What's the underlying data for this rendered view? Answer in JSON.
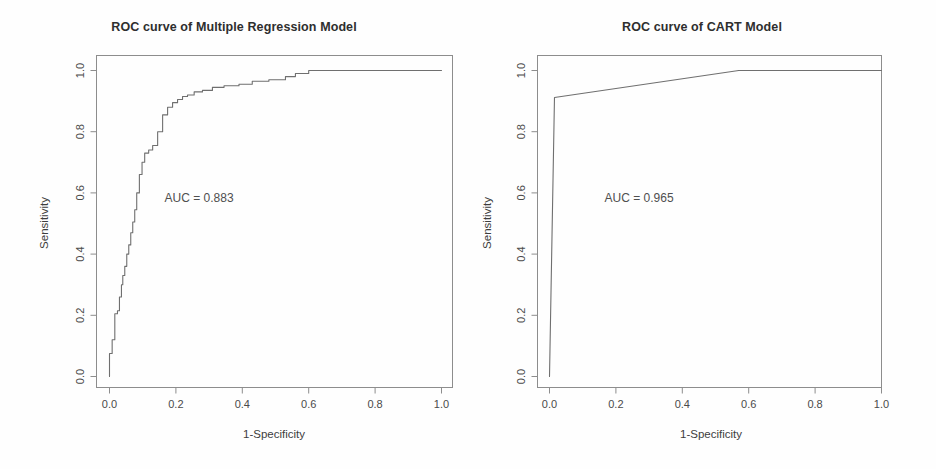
{
  "figure": {
    "width": 936,
    "height": 469,
    "background": "#fefefe",
    "line_color": "#6f6f6f",
    "frame_color": "#8d8d8d",
    "text_color": "#3a3a3a"
  },
  "panels": [
    {
      "id": "multiple-regression",
      "title": "ROC curve of Multiple Regression Model",
      "auc_label": "AUC = 0.883",
      "xlabel": "1-Specificity",
      "ylabel": "Sensitivity"
    },
    {
      "id": "cart",
      "title": "ROC curve of CART Model",
      "auc_label": "AUC = 0.965",
      "xlabel": "1-Specificity",
      "ylabel": "Sensitivity"
    }
  ],
  "axis": {
    "xticks": [
      "0.0",
      "0.2",
      "0.4",
      "0.6",
      "0.8",
      "1.0"
    ],
    "yticks": [
      "0.0",
      "0.2",
      "0.4",
      "0.6",
      "0.8",
      "1.0"
    ],
    "xtick_values": [
      0.0,
      0.2,
      0.4,
      0.6,
      0.8,
      1.0
    ],
    "ytick_values": [
      0.0,
      0.2,
      0.4,
      0.6,
      0.8,
      1.0
    ]
  },
  "chart_data": {
    "type": "line",
    "xlabel": "1-Specificity",
    "ylabel": "Sensitivity",
    "xlim": [
      0.0,
      1.0
    ],
    "ylim": [
      0.0,
      1.0
    ],
    "grid": false,
    "legend": "none",
    "panels": [
      {
        "name": "ROC curve of Multiple Regression Model",
        "auc": 0.883,
        "annotation": "AUC = 0.883",
        "annotation_xy": [
          0.27,
          0.57
        ],
        "x": [
          0.0,
          0.0,
          0.008,
          0.008,
          0.016,
          0.016,
          0.024,
          0.024,
          0.03,
          0.03,
          0.036,
          0.036,
          0.04,
          0.04,
          0.046,
          0.046,
          0.052,
          0.052,
          0.058,
          0.058,
          0.064,
          0.064,
          0.07,
          0.07,
          0.076,
          0.076,
          0.082,
          0.082,
          0.09,
          0.09,
          0.098,
          0.098,
          0.106,
          0.106,
          0.118,
          0.118,
          0.13,
          0.13,
          0.145,
          0.145,
          0.16,
          0.16,
          0.175,
          0.175,
          0.19,
          0.19,
          0.205,
          0.205,
          0.22,
          0.22,
          0.235,
          0.235,
          0.255,
          0.255,
          0.28,
          0.28,
          0.31,
          0.31,
          0.345,
          0.345,
          0.39,
          0.39,
          0.43,
          0.43,
          0.48,
          0.48,
          0.53,
          0.53,
          0.56,
          0.56,
          0.6,
          0.6,
          1.0
        ],
        "y": [
          0.0,
          0.075,
          0.075,
          0.12,
          0.12,
          0.205,
          0.205,
          0.215,
          0.215,
          0.26,
          0.26,
          0.3,
          0.3,
          0.33,
          0.33,
          0.36,
          0.36,
          0.4,
          0.4,
          0.43,
          0.43,
          0.47,
          0.47,
          0.505,
          0.505,
          0.545,
          0.545,
          0.6,
          0.6,
          0.66,
          0.66,
          0.7,
          0.7,
          0.73,
          0.73,
          0.74,
          0.74,
          0.755,
          0.755,
          0.8,
          0.8,
          0.855,
          0.855,
          0.88,
          0.88,
          0.895,
          0.895,
          0.905,
          0.905,
          0.915,
          0.915,
          0.92,
          0.92,
          0.93,
          0.93,
          0.935,
          0.935,
          0.945,
          0.945,
          0.95,
          0.95,
          0.955,
          0.955,
          0.965,
          0.965,
          0.97,
          0.97,
          0.98,
          0.98,
          0.99,
          0.99,
          1.0,
          1.0
        ]
      },
      {
        "name": "ROC curve of CART Model",
        "auc": 0.965,
        "annotation": "AUC = 0.965",
        "annotation_xy": [
          0.27,
          0.57
        ],
        "x": [
          0.0,
          0.015,
          0.57,
          1.0
        ],
        "y": [
          0.0,
          0.912,
          1.0,
          1.0
        ]
      }
    ]
  }
}
